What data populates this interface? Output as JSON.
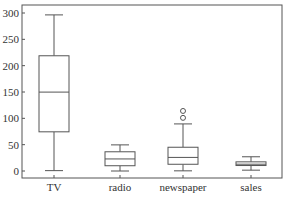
{
  "chart_data": {
    "type": "box",
    "title": "",
    "xlabel": "",
    "ylabel": "",
    "ylim": [
      -5,
      312
    ],
    "yticks": [
      0,
      50,
      100,
      150,
      200,
      250,
      300
    ],
    "ytick_labels": [
      "0",
      "50",
      "100",
      "150",
      "200",
      "250",
      "300"
    ],
    "grid": false,
    "categories": [
      "TV",
      "radio",
      "newspaper",
      "sales"
    ],
    "boxes": [
      {
        "name": "TV",
        "whisker_low": 0.7,
        "q1": 74.4,
        "median": 149.8,
        "q3": 218.8,
        "whisker_high": 296.4,
        "fliers": []
      },
      {
        "name": "radio",
        "whisker_low": 0.0,
        "q1": 10.0,
        "median": 22.9,
        "q3": 36.5,
        "whisker_high": 49.6,
        "fliers": []
      },
      {
        "name": "newspaper",
        "whisker_low": 0.3,
        "q1": 12.8,
        "median": 25.8,
        "q3": 45.1,
        "whisker_high": 89.4,
        "fliers": [
          100.9,
          114.0
        ]
      },
      {
        "name": "sales",
        "whisker_low": 1.6,
        "q1": 10.4,
        "median": 12.9,
        "q3": 17.4,
        "whisker_high": 27.0,
        "fliers": []
      }
    ]
  }
}
